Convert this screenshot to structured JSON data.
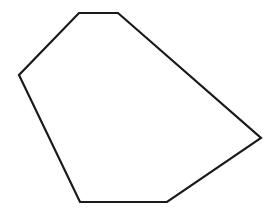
{
  "figure": {
    "kind": "line-drawing",
    "background_color": "#ffffff",
    "stroke_color": "#1a1a1a",
    "fill_color": "none",
    "stroke_width": 2.2,
    "canvas": {
      "width": 277,
      "height": 214
    }
  },
  "shape": {
    "name": "hexagon",
    "closed": true,
    "side_count": 6,
    "vertex_count": 6,
    "points_attr": "79,13 118,13 261,138 167,202 80,202 19,75",
    "vertices": [
      {
        "label": "top-left",
        "x": 79,
        "y": 13
      },
      {
        "label": "top-right",
        "x": 118,
        "y": 13
      },
      {
        "label": "right",
        "x": 261,
        "y": 138
      },
      {
        "label": "bottom-right",
        "x": 167,
        "y": 202
      },
      {
        "label": "bottom-left",
        "x": 80,
        "y": 202
      },
      {
        "label": "left",
        "x": 19,
        "y": 75
      }
    ],
    "edges": [
      {
        "from": "top-left",
        "to": "top-right",
        "orientation": "horizontal"
      },
      {
        "from": "top-right",
        "to": "right",
        "orientation": "diagonal-down-right"
      },
      {
        "from": "right",
        "to": "bottom-right",
        "orientation": "diagonal-down-left"
      },
      {
        "from": "bottom-right",
        "to": "bottom-left",
        "orientation": "horizontal"
      },
      {
        "from": "bottom-left",
        "to": "left",
        "orientation": "diagonal-up-left"
      },
      {
        "from": "left",
        "to": "top-left",
        "orientation": "diagonal-up-right"
      }
    ]
  }
}
